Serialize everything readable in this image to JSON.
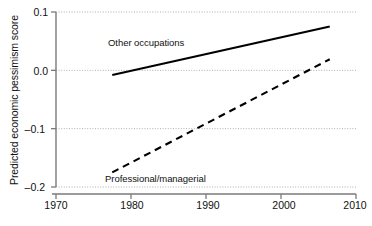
{
  "chart_data": {
    "type": "line",
    "title": "",
    "xlabel": "",
    "ylabel": "Predicted economic pessimism score",
    "xlim": [
      1970,
      2010
    ],
    "ylim": [
      -0.2,
      0.1
    ],
    "grid": true,
    "grid_axis": "y",
    "legend": "inline-annotations",
    "xticks": [
      "1970",
      "1980",
      "1990",
      "2000",
      "2010"
    ],
    "xtick_values": [
      1970,
      1980,
      1990,
      2000,
      2010
    ],
    "yticks": [
      "0.1",
      "0.0",
      "–0.1",
      "–0.2"
    ],
    "ytick_values": [
      0.1,
      0.0,
      -0.1,
      -0.2
    ],
    "series": [
      {
        "name": "Other occupations",
        "style": "solid",
        "color": "#000000",
        "x": [
          1977.5,
          2006.5
        ],
        "values": [
          -0.008,
          0.075
        ],
        "label": "Other occupations",
        "label_x": 1984.5,
        "label_y": 0.0455
      },
      {
        "name": "Professional/managerial",
        "style": "dashed",
        "color": "#000000",
        "x": [
          1977.5,
          2006.5
        ],
        "values": [
          -0.175,
          0.019
        ],
        "label": "Professional/managerial",
        "label_x": 1984.2,
        "label_y": -0.1855
      }
    ]
  },
  "axes": {
    "y_axis_title": "Predicted economic pessimism score",
    "ytick_0": "0.1",
    "ytick_1": "0.0",
    "ytick_2": "–0.1",
    "ytick_3": "–0.2",
    "xtick_0": "1970",
    "xtick_1": "1980",
    "xtick_2": "1990",
    "xtick_3": "2000",
    "xtick_4": "2010"
  },
  "annotations": {
    "other_occupations": "Other occupations",
    "professional_managerial": "Professional/managerial"
  },
  "colors": {
    "line": "#000000",
    "grid": "#9a9a9a",
    "axis": "#7a7a7a",
    "text": "#111111"
  }
}
